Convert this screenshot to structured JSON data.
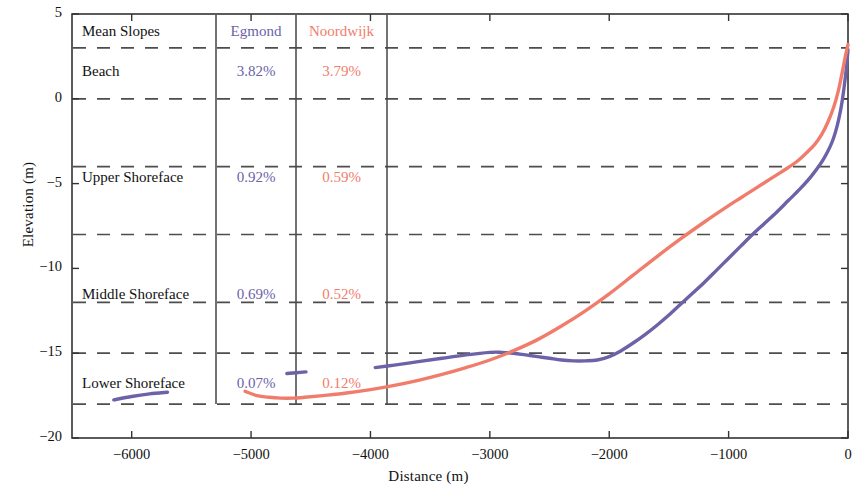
{
  "axes": {
    "ylabel": "Elevation (m)",
    "xlabel": "Distance (m)",
    "yticks": [
      "5",
      "0",
      "-5",
      "-10",
      "-15",
      "-20"
    ],
    "xticks": [
      "-6000",
      "-5000",
      "-4000",
      "-3000",
      "-2000",
      "-1000",
      "0"
    ]
  },
  "table": {
    "header": [
      "Mean Slopes",
      "Egmond",
      "Noordwijk"
    ],
    "rows": [
      {
        "label": "Beach",
        "egmond": "3.82%",
        "noordwijk": "3.79%"
      },
      {
        "label": "Upper Shoreface",
        "egmond": "0.92%",
        "noordwijk": "0.59%"
      },
      {
        "label": "Middle Shoreface",
        "egmond": "0.69%",
        "noordwijk": "0.52%"
      },
      {
        "label": "Lower Shoreface",
        "egmond": "0.07%",
        "noordwijk": "0.12%"
      }
    ]
  },
  "colors": {
    "egmond": "#6b62a8",
    "noordwijk": "#f07d6c",
    "axis": "#333333",
    "grid": "#4d4d4d"
  },
  "chart_data": {
    "type": "line",
    "title": "",
    "xlabel": "Distance (m)",
    "ylabel": "Elevation (m)",
    "xlim": [
      -6500,
      0
    ],
    "ylim": [
      -20,
      5
    ],
    "grid": true,
    "grid_style": "dashed horizontal",
    "gridlines_y": [
      3,
      0,
      -4,
      -8,
      -12,
      -15,
      -18
    ],
    "legend": "in-plot table",
    "series": [
      {
        "name": "Egmond",
        "color": "#6b62a8",
        "segments": [
          {
            "comment": "lower shoreface isolated segment 1",
            "x": [
              -6150,
              -6000,
              -5850,
              -5700
            ],
            "y": [
              -17.75,
              -17.55,
              -17.4,
              -17.3
            ]
          },
          {
            "comment": "lower shoreface isolated segment 2",
            "x": [
              -4700,
              -4620,
              -4540
            ],
            "y": [
              -16.2,
              -16.15,
              -16.1
            ]
          },
          {
            "comment": "main profile from -3960 to shoreline",
            "x": [
              -3960,
              -3800,
              -3600,
              -3400,
              -3200,
              -3000,
              -2900,
              -2800,
              -2700,
              -2600,
              -2500,
              -2400,
              -2300,
              -2200,
              -2100,
              -2000,
              -1900,
              -1800,
              -1700,
              -1600,
              -1500,
              -1400,
              -1300,
              -1200,
              -1100,
              -1000,
              -900,
              -800,
              -700,
              -600,
              -500,
              -400,
              -300,
              -200,
              -120,
              -60,
              -20,
              0
            ],
            "y": [
              -15.85,
              -15.7,
              -15.5,
              -15.3,
              -15.1,
              -14.95,
              -14.95,
              -15.0,
              -15.1,
              -15.2,
              -15.3,
              -15.4,
              -15.45,
              -15.45,
              -15.4,
              -15.2,
              -14.85,
              -14.4,
              -13.9,
              -13.35,
              -12.75,
              -12.1,
              -11.45,
              -10.8,
              -10.1,
              -9.4,
              -8.7,
              -8.0,
              -7.35,
              -6.7,
              -6.0,
              -5.3,
              -4.5,
              -3.5,
              -2.3,
              -0.6,
              1.4,
              2.9
            ]
          }
        ]
      },
      {
        "name": "Noordwijk",
        "color": "#f07d6c",
        "segments": [
          {
            "comment": "continuous profile from -5050 to shoreline",
            "x": [
              -5050,
              -4950,
              -4850,
              -4750,
              -4650,
              -4550,
              -4400,
              -4200,
              -4000,
              -3800,
              -3600,
              -3400,
              -3200,
              -3000,
              -2800,
              -2600,
              -2400,
              -2200,
              -2000,
              -1800,
              -1600,
              -1400,
              -1200,
              -1000,
              -900,
              -800,
              -700,
              -600,
              -500,
              -420,
              -350,
              -280,
              -220,
              -170,
              -120,
              -80,
              -50,
              -25,
              0
            ],
            "y": [
              -17.25,
              -17.5,
              -17.6,
              -17.65,
              -17.65,
              -17.6,
              -17.5,
              -17.35,
              -17.15,
              -16.9,
              -16.6,
              -16.25,
              -15.85,
              -15.4,
              -14.85,
              -14.2,
              -13.4,
              -12.5,
              -11.5,
              -10.4,
              -9.3,
              -8.25,
              -7.25,
              -6.3,
              -5.85,
              -5.4,
              -4.95,
              -4.5,
              -4.05,
              -3.65,
              -3.2,
              -2.7,
              -2.1,
              -1.4,
              -0.5,
              0.5,
              1.5,
              2.4,
              3.2
            ]
          }
        ]
      }
    ]
  }
}
